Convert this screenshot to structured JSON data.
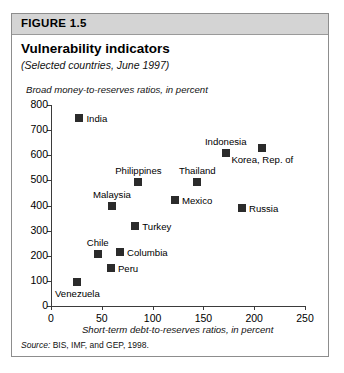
{
  "figure": {
    "number": "FIGURE 1.5",
    "title": "Vulnerability indicators",
    "subtitle": "(Selected countries, June 1997)",
    "source": "Source: BIS, IMF, and GEP, 1998.",
    "source_word": "Source:",
    "source_rest": " BIS, IMF, and GEP, 1998."
  },
  "chart_data": {
    "type": "scatter",
    "title": "Vulnerability indicators",
    "subtitle": "(Selected countries, June 1997)",
    "xlabel": "Short-term debt-to-reserves ratios, in percent",
    "ylabel": "Broad money-to-reserves ratios, in percent",
    "xlim": [
      0,
      250
    ],
    "ylim": [
      0,
      800
    ],
    "xticks": [
      0,
      50,
      100,
      150,
      200,
      250
    ],
    "yticks": [
      0,
      100,
      200,
      300,
      400,
      500,
      600,
      700,
      800
    ],
    "ytick_labels": [
      "0",
      "100",
      "200",
      "300",
      "400",
      "500",
      "600",
      "700",
      "800"
    ],
    "xtick_labels": [
      "0",
      "50",
      "100",
      "150",
      "200",
      "250"
    ],
    "grid": false,
    "legend": "none",
    "marker": "filled-square",
    "marker_color": "#2b2b2b",
    "points": [
      {
        "label": "India",
        "x": 28,
        "y": 750,
        "label_pos": "right"
      },
      {
        "label": "Indonesia",
        "x": 172,
        "y": 610,
        "label_pos": "above"
      },
      {
        "label": "Korea, Rep. of",
        "x": 208,
        "y": 630,
        "label_pos": "below"
      },
      {
        "label": "Philippines",
        "x": 86,
        "y": 495,
        "label_pos": "above"
      },
      {
        "label": "Thailand",
        "x": 144,
        "y": 495,
        "label_pos": "above"
      },
      {
        "label": "Mexico",
        "x": 122,
        "y": 420,
        "label_pos": "right"
      },
      {
        "label": "Malaysia",
        "x": 60,
        "y": 400,
        "label_pos": "above"
      },
      {
        "label": "Russia",
        "x": 188,
        "y": 390,
        "label_pos": "right"
      },
      {
        "label": "Turkey",
        "x": 83,
        "y": 320,
        "label_pos": "right"
      },
      {
        "label": "Columbia",
        "x": 68,
        "y": 215,
        "label_pos": "right"
      },
      {
        "label": "Chile",
        "x": 46,
        "y": 205,
        "label_pos": "above"
      },
      {
        "label": "Peru",
        "x": 59,
        "y": 150,
        "label_pos": "right"
      },
      {
        "label": "Venezuela",
        "x": 26,
        "y": 95,
        "label_pos": "below"
      }
    ]
  }
}
